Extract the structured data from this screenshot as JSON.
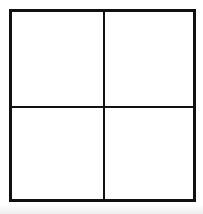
{
  "figure": {
    "type": "quadrant-grid",
    "background_color": "#ffffff",
    "line_color": "#111111",
    "canvas": {
      "width": 203,
      "height": 214
    },
    "square": {
      "x": 9,
      "y": 9,
      "width": 187,
      "height": 193
    },
    "rows": 2,
    "columns": 2,
    "border_thickness_px": 3,
    "divider_thickness_px": 2,
    "cells": [
      {
        "position": "top-left",
        "row": 0,
        "column": 0,
        "text": ""
      },
      {
        "position": "top-right",
        "row": 0,
        "column": 1,
        "text": ""
      },
      {
        "position": "bottom-left",
        "row": 1,
        "column": 0,
        "text": ""
      },
      {
        "position": "bottom-right",
        "row": 1,
        "column": 1,
        "text": ""
      }
    ]
  }
}
